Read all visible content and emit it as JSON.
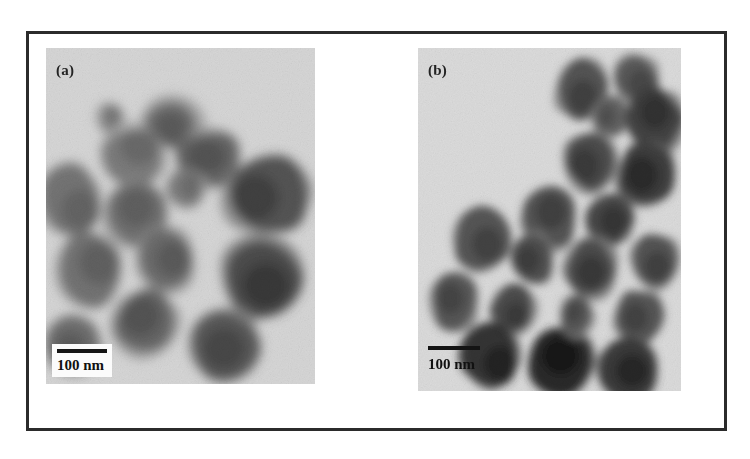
{
  "figure": {
    "caption_present": false,
    "frame_color": "#2b2b2b",
    "background_color": "#ffffff",
    "panel_count": 2
  },
  "panels": [
    {
      "id": "a",
      "label": "(a)",
      "modality": "TEM micrograph",
      "background_tone": "#d7d7d7",
      "particle_tone": "#9a9a9a",
      "description": "Agglomerated faceted nanoparticles, light-to-medium contrast",
      "scalebar": {
        "label": "100 nm",
        "bar_color": "#141414",
        "has_white_box": true,
        "box_color": "#fbfbfb"
      }
    },
    {
      "id": "b",
      "label": "(b)",
      "modality": "TEM micrograph",
      "background_tone": "#dcdcdc",
      "particle_tone": "#7d7d7d",
      "description": "Discrete rounded nanoparticles, darker contrast, chain-like clusters",
      "scalebar": {
        "label": "100 nm",
        "bar_color": "#141414",
        "has_white_box": false,
        "box_color": "transparent"
      }
    }
  ],
  "particles": {
    "panel_a": [
      {
        "cx": 0.47,
        "cy": 0.23,
        "rx": 0.115,
        "ry": 0.085,
        "rot": -12,
        "tone": 0.4,
        "sides": 7
      },
      {
        "cx": 0.33,
        "cy": 0.32,
        "rx": 0.135,
        "ry": 0.105,
        "rot": 18,
        "tone": 0.46,
        "sides": 6
      },
      {
        "cx": 0.6,
        "cy": 0.33,
        "rx": 0.14,
        "ry": 0.095,
        "rot": 5,
        "tone": 0.38,
        "sides": 7
      },
      {
        "cx": 0.09,
        "cy": 0.45,
        "rx": 0.135,
        "ry": 0.115,
        "rot": -20,
        "tone": 0.44,
        "sides": 6
      },
      {
        "cx": 0.33,
        "cy": 0.5,
        "rx": 0.13,
        "ry": 0.11,
        "rot": 10,
        "tone": 0.42,
        "sides": 7
      },
      {
        "cx": 0.82,
        "cy": 0.44,
        "rx": 0.17,
        "ry": 0.135,
        "rot": -8,
        "tone": 0.3,
        "sides": 7
      },
      {
        "cx": 0.16,
        "cy": 0.66,
        "rx": 0.15,
        "ry": 0.125,
        "rot": 14,
        "tone": 0.43,
        "sides": 6
      },
      {
        "cx": 0.45,
        "cy": 0.63,
        "rx": 0.12,
        "ry": 0.1,
        "rot": -6,
        "tone": 0.4,
        "sides": 7
      },
      {
        "cx": 0.8,
        "cy": 0.68,
        "rx": 0.165,
        "ry": 0.13,
        "rot": 8,
        "tone": 0.27,
        "sides": 7
      },
      {
        "cx": 0.37,
        "cy": 0.82,
        "rx": 0.14,
        "ry": 0.115,
        "rot": -15,
        "tone": 0.38,
        "sides": 6
      },
      {
        "cx": 0.66,
        "cy": 0.88,
        "rx": 0.15,
        "ry": 0.12,
        "rot": 6,
        "tone": 0.33,
        "sides": 7
      },
      {
        "cx": 0.1,
        "cy": 0.88,
        "rx": 0.12,
        "ry": 0.1,
        "rot": 20,
        "tone": 0.41,
        "sides": 6
      },
      {
        "cx": 0.52,
        "cy": 0.42,
        "rx": 0.085,
        "ry": 0.07,
        "rot": 0,
        "tone": 0.47,
        "sides": 6
      },
      {
        "cx": 0.24,
        "cy": 0.21,
        "rx": 0.06,
        "ry": 0.05,
        "rot": 0,
        "tone": 0.5,
        "sides": 6
      }
    ],
    "panel_b": [
      {
        "cx": 0.62,
        "cy": 0.12,
        "rx": 0.105,
        "ry": 0.095,
        "rot": -10,
        "tone": 0.3,
        "sides": 9
      },
      {
        "cx": 0.83,
        "cy": 0.09,
        "rx": 0.09,
        "ry": 0.078,
        "rot": 8,
        "tone": 0.33,
        "sides": 9
      },
      {
        "cx": 0.73,
        "cy": 0.2,
        "rx": 0.07,
        "ry": 0.062,
        "rot": 0,
        "tone": 0.36,
        "sides": 8
      },
      {
        "cx": 0.9,
        "cy": 0.21,
        "rx": 0.115,
        "ry": 0.1,
        "rot": -6,
        "tone": 0.24,
        "sides": 9
      },
      {
        "cx": 0.66,
        "cy": 0.33,
        "rx": 0.11,
        "ry": 0.098,
        "rot": 12,
        "tone": 0.28,
        "sides": 9
      },
      {
        "cx": 0.87,
        "cy": 0.37,
        "rx": 0.12,
        "ry": 0.105,
        "rot": -4,
        "tone": 0.22,
        "sides": 9
      },
      {
        "cx": 0.5,
        "cy": 0.5,
        "rx": 0.11,
        "ry": 0.098,
        "rot": 6,
        "tone": 0.3,
        "sides": 9
      },
      {
        "cx": 0.73,
        "cy": 0.5,
        "rx": 0.095,
        "ry": 0.085,
        "rot": 0,
        "tone": 0.26,
        "sides": 9
      },
      {
        "cx": 0.24,
        "cy": 0.56,
        "rx": 0.115,
        "ry": 0.1,
        "rot": -14,
        "tone": 0.31,
        "sides": 9
      },
      {
        "cx": 0.44,
        "cy": 0.62,
        "rx": 0.09,
        "ry": 0.082,
        "rot": 4,
        "tone": 0.29,
        "sides": 8
      },
      {
        "cx": 0.66,
        "cy": 0.64,
        "rx": 0.105,
        "ry": 0.092,
        "rot": 10,
        "tone": 0.27,
        "sides": 9
      },
      {
        "cx": 0.9,
        "cy": 0.62,
        "rx": 0.095,
        "ry": 0.085,
        "rot": 0,
        "tone": 0.3,
        "sides": 9
      },
      {
        "cx": 0.14,
        "cy": 0.74,
        "rx": 0.1,
        "ry": 0.09,
        "rot": 6,
        "tone": 0.32,
        "sides": 9
      },
      {
        "cx": 0.36,
        "cy": 0.76,
        "rx": 0.09,
        "ry": 0.08,
        "rot": -8,
        "tone": 0.28,
        "sides": 8
      },
      {
        "cx": 0.84,
        "cy": 0.78,
        "rx": 0.095,
        "ry": 0.085,
        "rot": 0,
        "tone": 0.31,
        "sides": 9
      },
      {
        "cx": 0.28,
        "cy": 0.9,
        "rx": 0.12,
        "ry": 0.098,
        "rot": 8,
        "tone": 0.18,
        "sides": 9
      },
      {
        "cx": 0.55,
        "cy": 0.92,
        "rx": 0.135,
        "ry": 0.105,
        "rot": -6,
        "tone": 0.14,
        "sides": 9
      },
      {
        "cx": 0.8,
        "cy": 0.94,
        "rx": 0.12,
        "ry": 0.095,
        "rot": 4,
        "tone": 0.2,
        "sides": 9
      },
      {
        "cx": 0.6,
        "cy": 0.78,
        "rx": 0.07,
        "ry": 0.062,
        "rot": 0,
        "tone": 0.33,
        "sides": 8
      }
    ]
  }
}
